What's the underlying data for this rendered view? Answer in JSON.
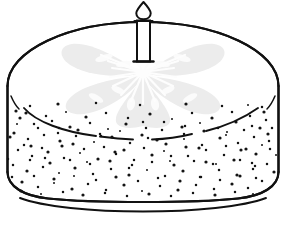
{
  "scene": {
    "title": "Birthday cake with single candle",
    "subject": "birthday-cake",
    "style": "black and white line drawing / coloring page",
    "background_color": "#ffffff",
    "ink_color": "#111111",
    "canvas": {
      "width": 286,
      "height": 229
    }
  },
  "colors": {
    "background": "#ffffff",
    "outline": "#111111",
    "flower_petal": "#ececec",
    "flower_vein": "#fbfbfb",
    "speckle": "#141414",
    "candle_body": "#ffffff"
  },
  "cake": {
    "label": "round layer cake",
    "top_surface_label": "frosted cake top",
    "side_label": "speckled cake side",
    "top_ellipse": {
      "cx": 143,
      "cy": 86,
      "rx": 136,
      "ry": 64
    },
    "side_height": 112,
    "bottom_edge_y": 198,
    "plate_line_y": 208,
    "icing_drip_label": "icing drip line",
    "speckle_count": 196,
    "speckle_radius": 1.25
  },
  "candle": {
    "label": "birthday candle",
    "body": {
      "x": 137,
      "y": 20,
      "width": 13,
      "height": 42
    },
    "foot_label": "candle base flange",
    "wick_label": "candle wick",
    "flame_label": "candle flame",
    "flame_center": {
      "cx": 143.5,
      "cy": 9
    },
    "count": 1
  },
  "flower": {
    "label": "frosting flower decoration",
    "petal_count": 5,
    "center": {
      "cx": 143,
      "cy": 72
    },
    "radius": 62,
    "petals": [
      {
        "name": "petal-top-left",
        "angle": 198
      },
      {
        "name": "petal-top-right",
        "angle": 342
      },
      {
        "name": "petal-left",
        "angle": 150
      },
      {
        "name": "petal-right",
        "angle": 30
      },
      {
        "name": "petal-bottom",
        "angle": 90
      }
    ],
    "ray_count": 17,
    "ray_label": "frosting highlight rays"
  },
  "speckles": {
    "label": "poppy seed speckles on cake side",
    "points": [
      [
        20,
        118
      ],
      [
        34,
        124
      ],
      [
        52,
        121
      ],
      [
        70,
        127
      ],
      [
        90,
        123
      ],
      [
        108,
        129
      ],
      [
        126,
        124
      ],
      [
        146,
        128
      ],
      [
        164,
        122
      ],
      [
        182,
        127
      ],
      [
        200,
        123
      ],
      [
        218,
        128
      ],
      [
        236,
        122
      ],
      [
        252,
        126
      ],
      [
        266,
        120
      ],
      [
        14,
        133
      ],
      [
        28,
        139
      ],
      [
        44,
        135
      ],
      [
        60,
        141
      ],
      [
        76,
        136
      ],
      [
        94,
        142
      ],
      [
        112,
        137
      ],
      [
        130,
        143
      ],
      [
        148,
        138
      ],
      [
        166,
        144
      ],
      [
        184,
        139
      ],
      [
        202,
        145
      ],
      [
        220,
        138
      ],
      [
        238,
        143
      ],
      [
        254,
        137
      ],
      [
        268,
        134
      ],
      [
        18,
        150
      ],
      [
        32,
        156
      ],
      [
        48,
        152
      ],
      [
        64,
        158
      ],
      [
        80,
        153
      ],
      [
        98,
        159
      ],
      [
        116,
        154
      ],
      [
        134,
        160
      ],
      [
        152,
        155
      ],
      [
        170,
        161
      ],
      [
        188,
        156
      ],
      [
        206,
        162
      ],
      [
        224,
        155
      ],
      [
        240,
        160
      ],
      [
        256,
        154
      ],
      [
        270,
        149
      ],
      [
        13,
        165
      ],
      [
        27,
        171
      ],
      [
        43,
        167
      ],
      [
        59,
        173
      ],
      [
        75,
        168
      ],
      [
        93,
        174
      ],
      [
        111,
        169
      ],
      [
        129,
        175
      ],
      [
        147,
        170
      ],
      [
        165,
        176
      ],
      [
        183,
        171
      ],
      [
        201,
        177
      ],
      [
        219,
        170
      ],
      [
        237,
        175
      ],
      [
        253,
        169
      ],
      [
        267,
        164
      ],
      [
        22,
        182
      ],
      [
        38,
        187
      ],
      [
        54,
        183
      ],
      [
        72,
        189
      ],
      [
        88,
        184
      ],
      [
        106,
        190
      ],
      [
        124,
        185
      ],
      [
        142,
        191
      ],
      [
        160,
        186
      ],
      [
        178,
        190
      ],
      [
        196,
        185
      ],
      [
        214,
        189
      ],
      [
        232,
        184
      ],
      [
        248,
        188
      ],
      [
        262,
        181
      ],
      [
        26,
        113
      ],
      [
        46,
        116
      ],
      [
        66,
        112
      ],
      [
        86,
        117
      ],
      [
        106,
        113
      ],
      [
        128,
        118
      ],
      [
        150,
        114
      ],
      [
        172,
        119
      ],
      [
        192,
        113
      ],
      [
        212,
        118
      ],
      [
        232,
        112
      ],
      [
        250,
        116
      ],
      [
        264,
        112
      ],
      [
        38,
        128
      ],
      [
        58,
        133
      ],
      [
        78,
        130
      ],
      [
        100,
        134
      ],
      [
        120,
        131
      ],
      [
        142,
        135
      ],
      [
        162,
        130
      ],
      [
        184,
        134
      ],
      [
        204,
        131
      ],
      [
        226,
        135
      ],
      [
        244,
        130
      ],
      [
        260,
        128
      ],
      [
        24,
        145
      ],
      [
        42,
        148
      ],
      [
        62,
        146
      ],
      [
        84,
        149
      ],
      [
        104,
        147
      ],
      [
        124,
        150
      ],
      [
        144,
        148
      ],
      [
        164,
        151
      ],
      [
        186,
        147
      ],
      [
        206,
        150
      ],
      [
        226,
        146
      ],
      [
        246,
        149
      ],
      [
        262,
        145
      ],
      [
        30,
        160
      ],
      [
        50,
        163
      ],
      [
        70,
        160
      ],
      [
        90,
        164
      ],
      [
        110,
        161
      ],
      [
        132,
        165
      ],
      [
        152,
        162
      ],
      [
        174,
        165
      ],
      [
        194,
        161
      ],
      [
        216,
        164
      ],
      [
        234,
        160
      ],
      [
        252,
        163
      ],
      [
        34,
        176
      ],
      [
        54,
        179
      ],
      [
        74,
        176
      ],
      [
        96,
        180
      ],
      [
        116,
        177
      ],
      [
        138,
        181
      ],
      [
        158,
        178
      ],
      [
        180,
        181
      ],
      [
        200,
        177
      ],
      [
        220,
        180
      ],
      [
        240,
        176
      ],
      [
        256,
        178
      ],
      [
        17,
        124
      ],
      [
        31,
        146
      ],
      [
        45,
        158
      ],
      [
        59,
        128
      ],
      [
        73,
        144
      ],
      [
        87,
        162
      ],
      [
        101,
        136
      ],
      [
        115,
        152
      ],
      [
        129,
        168
      ],
      [
        143,
        122
      ],
      [
        157,
        140
      ],
      [
        171,
        156
      ],
      [
        185,
        126
      ],
      [
        199,
        148
      ],
      [
        213,
        164
      ],
      [
        227,
        132
      ],
      [
        241,
        150
      ],
      [
        255,
        166
      ],
      [
        269,
        141
      ],
      [
        21,
        191
      ],
      [
        41,
        194
      ],
      [
        63,
        192
      ],
      [
        83,
        195
      ],
      [
        105,
        193
      ],
      [
        127,
        196
      ],
      [
        149,
        194
      ],
      [
        171,
        196
      ],
      [
        193,
        193
      ],
      [
        215,
        195
      ],
      [
        235,
        192
      ],
      [
        253,
        194
      ],
      [
        16,
        111
      ],
      [
        262,
        107
      ],
      [
        272,
        128
      ],
      [
        10,
        137
      ],
      [
        276,
        155
      ],
      [
        8,
        159
      ],
      [
        274,
        172
      ],
      [
        12,
        177
      ],
      [
        30,
        106
      ],
      [
        58,
        104
      ],
      [
        96,
        103
      ],
      [
        140,
        105
      ],
      [
        186,
        104
      ],
      [
        222,
        106
      ],
      [
        248,
        105
      ]
    ]
  },
  "details": {
    "left_cheek_arc_label": "left edge shading arc",
    "right_cheek_arc_label": "right edge shading arc",
    "drip_segments": 4
  }
}
